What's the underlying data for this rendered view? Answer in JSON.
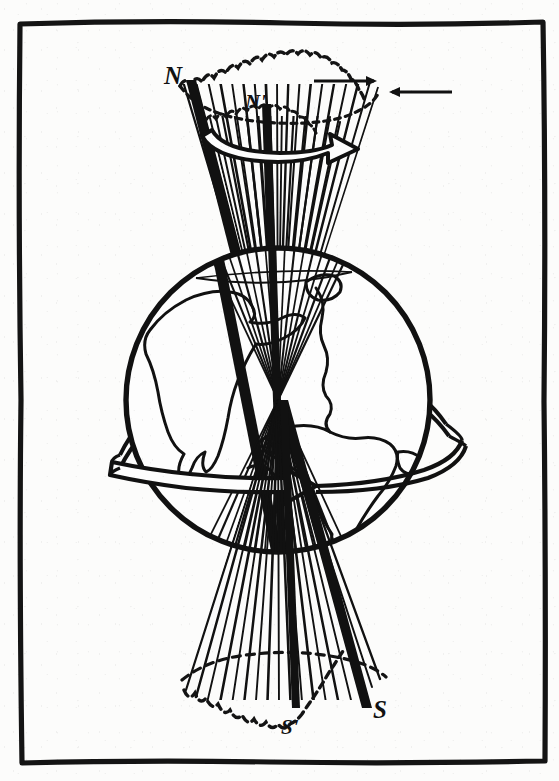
{
  "figure": {
    "kind": "line-drawing-diagram",
    "background_color": "#fcfcfb",
    "ink_color": "#111111",
    "frame": {
      "name": "hand-drawn-border",
      "x": 18,
      "y": 20,
      "width": 527,
      "height": 744,
      "stroke_width": 5
    }
  },
  "labels": {
    "north_pole": "N",
    "north_celestial_prime": "N'",
    "south_pole": "S",
    "south_celestial_prime": "S'"
  },
  "globe": {
    "name": "earth-sphere",
    "center_x": 278,
    "center_y": 400,
    "radius": 154,
    "stroke_width": 5,
    "continents": [
      "north-america",
      "south-america",
      "africa",
      "europe"
    ]
  },
  "equator_band": {
    "name": "equatorial-rotation-arrow",
    "direction": "eastward",
    "arrowhead": "right",
    "style": "hollow-double-line-ribbon"
  },
  "cones": [
    {
      "name": "north-precession-cone",
      "apex_x": 278,
      "apex_y": 400,
      "rim_center_x": 280,
      "rim_center_y": 84,
      "rim_rx": 100,
      "rim_ry": 20,
      "rim_style": "dashed-scalloped",
      "generatrix_count": 19,
      "label": "N"
    },
    {
      "name": "north-inner-cone",
      "apex_x": 278,
      "apex_y": 400,
      "rim_center_x": 276,
      "rim_center_y": 116,
      "rim_rx": 68,
      "rim_ry": 14,
      "rim_style": "dashed-scalloped",
      "label": "N'"
    },
    {
      "name": "south-precession-cone",
      "apex_x": 278,
      "apex_y": 400,
      "rim_center_x": 285,
      "rim_center_y": 690,
      "rim_rx": 105,
      "rim_ry": 24,
      "rim_style": "dashed-scalloped",
      "generatrix_count": 19,
      "label": "S"
    }
  ],
  "axis": {
    "name": "rotation-axis",
    "top_x": 186,
    "top_y": 80,
    "bottom_x": 362,
    "bottom_y": 716,
    "stroke_width": 6,
    "description": "current polar axis N to S"
  },
  "precession_axis": {
    "name": "mean-axis",
    "top_x": 262,
    "top_y": 104,
    "bottom_x": 296,
    "bottom_y": 710,
    "stroke_width": 4,
    "description": "mean axis N' to S'"
  },
  "arrows": [
    {
      "name": "precession-curved-arrow",
      "style": "hollow-double-line-curved",
      "direction": "right",
      "x": 212,
      "y": 126,
      "width": 122,
      "height": 24
    },
    {
      "name": "pointer-arrow-right",
      "style": "thin-solid",
      "direction": "right",
      "x": 314,
      "y": 80,
      "width": 62
    },
    {
      "name": "pointer-arrow-left",
      "style": "thin-solid",
      "direction": "left",
      "x": 386,
      "y": 90,
      "width": 66
    }
  ]
}
